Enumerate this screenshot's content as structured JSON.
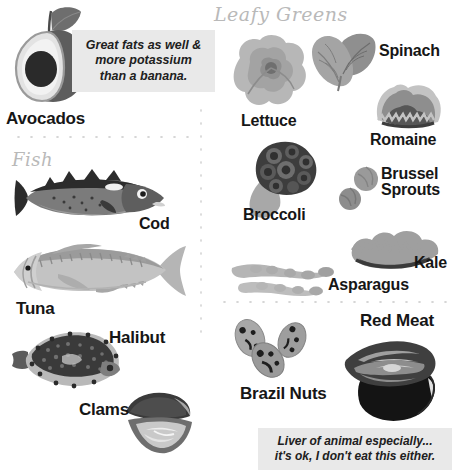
{
  "poster": {
    "title": "Selenium / Healthy Foods Infographic",
    "background": "#ffffff"
  },
  "sections": [
    {
      "id": "leafy-greens",
      "heading": "Leafy Greens",
      "style": "script"
    },
    {
      "id": "fish",
      "heading": "Fish",
      "style": "script"
    }
  ],
  "callouts": [
    {
      "id": "avocado-callout",
      "text": "Great fats as well &\nmore potassium\nthan a banana.",
      "background": "#e9e9e9",
      "text_color": "#202020"
    },
    {
      "id": "red-meat-callout",
      "text": "Liver of animal especially...\nit's ok, I don't eat this either.",
      "background": "#e9e9e9",
      "text_color": "#202020"
    }
  ],
  "items": [
    {
      "id": "avocados",
      "label": "Avocados",
      "group": "top-left"
    },
    {
      "id": "lettuce",
      "label": "Lettuce",
      "group": "leafy-greens"
    },
    {
      "id": "spinach",
      "label": "Spinach",
      "group": "leafy-greens"
    },
    {
      "id": "romaine",
      "label": "Romaine",
      "group": "leafy-greens"
    },
    {
      "id": "broccoli",
      "label": "Broccoli",
      "group": "leafy-greens"
    },
    {
      "id": "brussel-sprouts",
      "label": "Brussel\nSprouts",
      "group": "leafy-greens"
    },
    {
      "id": "kale",
      "label": "Kale",
      "group": "leafy-greens"
    },
    {
      "id": "asparagus",
      "label": "Asparagus",
      "group": "leafy-greens"
    },
    {
      "id": "cod",
      "label": "Cod",
      "group": "fish"
    },
    {
      "id": "tuna",
      "label": "Tuna",
      "group": "fish"
    },
    {
      "id": "halibut",
      "label": "Halibut",
      "group": "fish"
    },
    {
      "id": "clams",
      "label": "Clams",
      "group": "fish"
    },
    {
      "id": "brazil-nuts",
      "label": "Brazil Nuts",
      "group": "bottom-right"
    },
    {
      "id": "red-meat",
      "label": "Red Meat",
      "group": "bottom-right"
    }
  ],
  "palette": {
    "ink": "#161616",
    "dark": "#3a3a3a",
    "mid": "#7d7d7d",
    "light": "#b8b8b8",
    "pale": "#d8d8d8",
    "callout_bg": "#e9e9e9",
    "script_gray": "#b9b9b9",
    "dot_gray": "#d6d6d6"
  }
}
